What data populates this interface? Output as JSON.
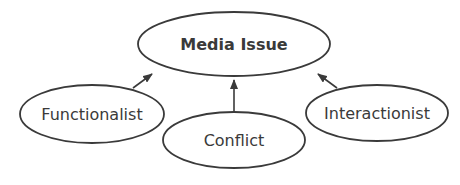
{
  "diagram": {
    "center_node": {
      "label": "Media Issue"
    },
    "nodes": [
      {
        "id": "functionalist",
        "label": "Functionalist"
      },
      {
        "id": "conflict",
        "label": "Conflict"
      },
      {
        "id": "interactionist",
        "label": "Interactionist"
      }
    ],
    "edges": [
      {
        "from": "Functionalist",
        "to": "Media Issue"
      },
      {
        "from": "Conflict",
        "to": "Media Issue"
      },
      {
        "from": "Interactionist",
        "to": "Media Issue"
      }
    ],
    "colors": {
      "stroke": "#3a3a3a",
      "text": "#3a3a3a",
      "background": "#ffffff"
    }
  }
}
